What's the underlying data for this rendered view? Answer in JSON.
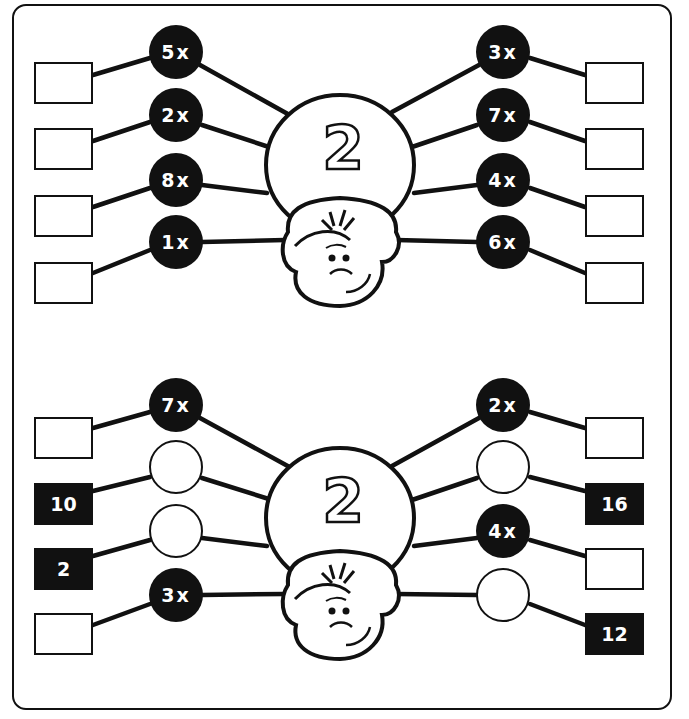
{
  "worksheet": {
    "title": "Multiplication spiders - table of 2",
    "colors": {
      "ink": "#111111",
      "paper": "#ffffff"
    },
    "spiders": [
      {
        "center_number": "2",
        "legs_left": [
          {
            "multiplier": "5x",
            "filled": true,
            "answer": "",
            "answer_given": false
          },
          {
            "multiplier": "2x",
            "filled": true,
            "answer": "",
            "answer_given": false
          },
          {
            "multiplier": "8x",
            "filled": true,
            "answer": "",
            "answer_given": false
          },
          {
            "multiplier": "1x",
            "filled": true,
            "answer": "",
            "answer_given": false
          }
        ],
        "legs_right": [
          {
            "multiplier": "3x",
            "filled": true,
            "answer": "",
            "answer_given": false
          },
          {
            "multiplier": "7x",
            "filled": true,
            "answer": "",
            "answer_given": false
          },
          {
            "multiplier": "4x",
            "filled": true,
            "answer": "",
            "answer_given": false
          },
          {
            "multiplier": "6x",
            "filled": true,
            "answer": "",
            "answer_given": false
          }
        ]
      },
      {
        "center_number": "2",
        "legs_left": [
          {
            "multiplier": "7x",
            "filled": true,
            "answer": "",
            "answer_given": false
          },
          {
            "multiplier": "",
            "filled": false,
            "answer": "10",
            "answer_given": true
          },
          {
            "multiplier": "",
            "filled": false,
            "answer": "2",
            "answer_given": true
          },
          {
            "multiplier": "3x",
            "filled": true,
            "answer": "",
            "answer_given": false
          }
        ],
        "legs_right": [
          {
            "multiplier": "2x",
            "filled": true,
            "answer": "",
            "answer_given": false
          },
          {
            "multiplier": "",
            "filled": false,
            "answer": "16",
            "answer_given": true
          },
          {
            "multiplier": "4x",
            "filled": true,
            "answer": "",
            "answer_given": false
          },
          {
            "multiplier": "",
            "filled": false,
            "answer": "12",
            "answer_given": true
          }
        ]
      }
    ]
  }
}
